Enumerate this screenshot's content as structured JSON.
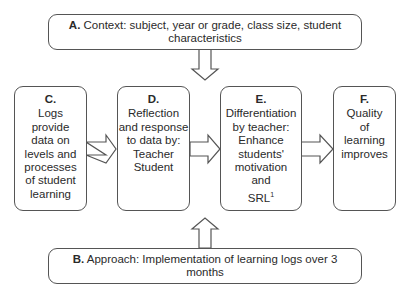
{
  "diagram": {
    "box_a": {
      "label": "A.",
      "text": "Context: subject, year or grade, class size, student characteristics"
    },
    "box_b": {
      "label": "B.",
      "text": "Approach: Implementation of learning logs over 3 months"
    },
    "box_c": {
      "label": "C.",
      "text": "Logs\nprovide\ndata on\nlevels and\nprocesses\nof student\nlearning"
    },
    "box_d": {
      "label": "D.",
      "text": "Reflection\nand response\nto data by:\nTeacher\nStudent"
    },
    "box_e": {
      "label": "E.",
      "text": "Differentiation\nby teacher:\nEnhance\nstudents'\nmotivation\nand\nSRL",
      "superscript": "1"
    },
    "box_f": {
      "label": "F.",
      "text": "Quality\nof\nlearning\nimproves"
    },
    "arrows": [
      {
        "from": "A",
        "to": "row",
        "direction": "down"
      },
      {
        "from": "C",
        "to": "D",
        "direction": "right"
      },
      {
        "from": "D",
        "to": "E",
        "direction": "right"
      },
      {
        "from": "E",
        "to": "F",
        "direction": "right"
      },
      {
        "from": "B",
        "to": "row",
        "direction": "up"
      }
    ]
  }
}
